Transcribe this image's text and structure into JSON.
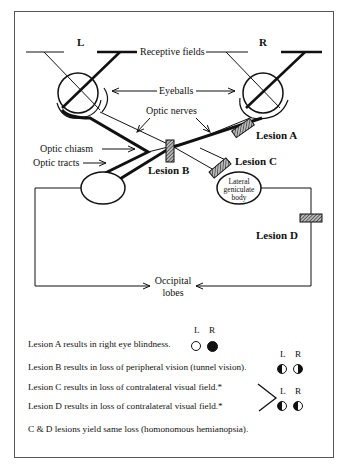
{
  "diagram": {
    "eyes": {
      "left": "L",
      "right": "R"
    },
    "labels": {
      "receptive_fields": "Receptive fields",
      "eyeballs": "Eyeballs",
      "optic_nerves": "Optic nerves",
      "optic_chiasm": "Optic chiasm",
      "optic_tracts": "Optic tracts",
      "lgb_line1": "Lateral",
      "lgb_line2": "geniculate",
      "lgb_line3": "body",
      "occipital_line1": "Occipital",
      "occipital_line2": "lobes"
    },
    "lesions": {
      "a": "Lesion A",
      "b": "Lesion B",
      "c": "Lesion C",
      "d": "Lesion D"
    }
  },
  "legend": {
    "col_l": "L",
    "col_r": "R",
    "items": [
      {
        "text": "Lesion A results in right eye blindness.",
        "left_field": "clear",
        "right_field": "full-loss"
      },
      {
        "text": "Lesion B results in loss of peripheral vision (tunnel vision).",
        "left_field": "left-half-loss",
        "right_field": "right-half-loss"
      },
      {
        "text": "Lesion C results in loss of contralateral visual field.*",
        "left_field": "left-half-loss",
        "right_field": "left-half-loss"
      },
      {
        "text": "Lesion D results in loss of contralateral visual field.*",
        "left_field": "left-half-loss",
        "right_field": "left-half-loss"
      }
    ],
    "footnote": "C & D lesions yield same loss (homonomous hemianopsia)."
  },
  "colors": {
    "line": "#111111",
    "hatch": "#444444",
    "border": "#555555"
  }
}
